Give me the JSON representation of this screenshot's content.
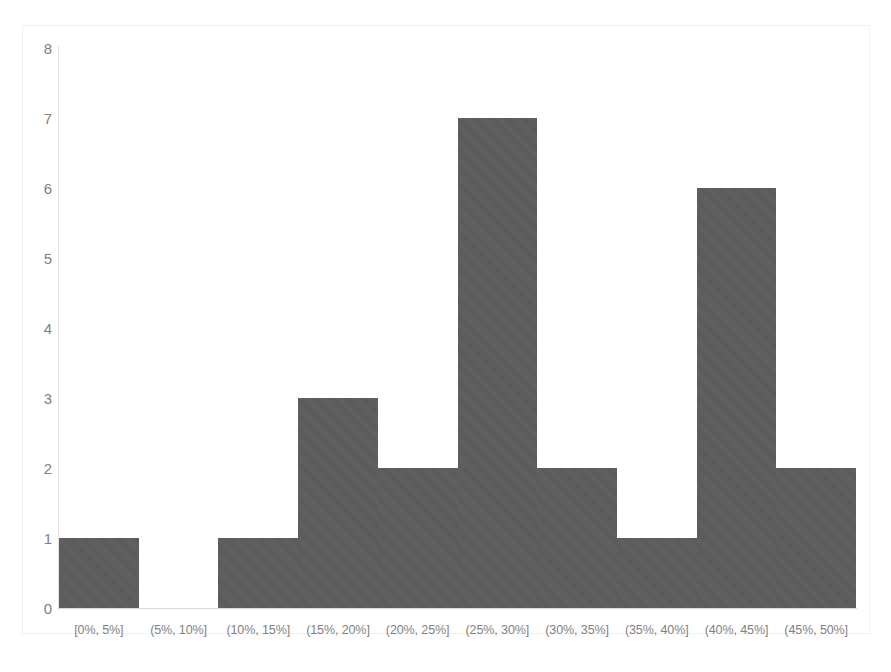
{
  "chart_data": {
    "type": "bar",
    "title": "",
    "subtitle": "",
    "xlabel": "",
    "ylabel": "",
    "categories": [
      "[0%, 5%]",
      "(5%, 10%]",
      "(10%, 15%]",
      "(15%, 20%]",
      "(20%, 25%]",
      "(25%, 30%]",
      "(30%, 35%]",
      "(35%, 40%]",
      "(40%, 45%]",
      "(45%, 50%]"
    ],
    "values": [
      1,
      0,
      1,
      3,
      2,
      7,
      2,
      1,
      6,
      2
    ],
    "ylim": [
      0,
      8
    ],
    "ytick_labels": [
      "8",
      "7",
      "6",
      "5",
      "4",
      "3",
      "2",
      "1",
      "0"
    ],
    "ytick_values": [
      8,
      7,
      6,
      5,
      4,
      3,
      2,
      1,
      0
    ],
    "ystep": 1,
    "grid": false,
    "legend": false,
    "legend_position": "none",
    "bar_color": "#595959",
    "axis_text_color": "#7f7f7f",
    "plot_background": "#ffffff",
    "border_color": "#f1f1f1"
  }
}
